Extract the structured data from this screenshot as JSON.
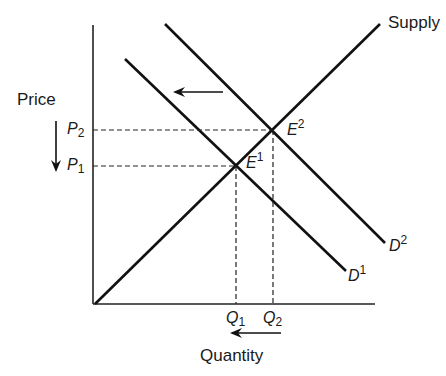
{
  "diagram": {
    "type": "supply-demand",
    "axes": {
      "y_label": "Price",
      "x_label": "Quantity"
    },
    "curves": [
      {
        "name": "Supply",
        "label": "Supply"
      },
      {
        "name": "D2",
        "label": "D",
        "sup": "2"
      },
      {
        "name": "D1",
        "label": "D",
        "sup": "1"
      }
    ],
    "equilibria": [
      {
        "label": "E",
        "sup": "1"
      },
      {
        "label": "E",
        "sup": "2"
      }
    ],
    "price_ticks": [
      {
        "label": "P",
        "sub": "2"
      },
      {
        "label": "P",
        "sub": "1"
      }
    ],
    "quantity_ticks": [
      {
        "label": "Q",
        "sub": "1"
      },
      {
        "label": "Q",
        "sub": "2"
      }
    ],
    "annotations": {
      "demand_shift": "leftward arrow",
      "price_change": "downward arrow",
      "quantity_change": "leftward arrow"
    }
  }
}
